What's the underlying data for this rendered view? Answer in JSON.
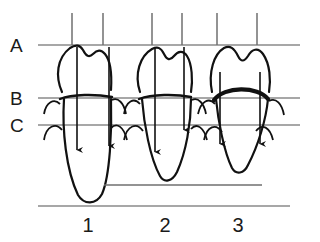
{
  "figure": {
    "background_color": "#ffffff",
    "ink_color": "#111111",
    "reference_line_color": "#8a8a8a"
  },
  "reference_lines": [
    {
      "label": "A",
      "y": 45,
      "x_start": 38,
      "x_end": 300,
      "description": "occlusal reference plane"
    },
    {
      "label": "B",
      "y": 98,
      "x_start": 38,
      "x_end": 300,
      "description": "cemento-enamel / gingival plane"
    },
    {
      "label": "C",
      "y": 125,
      "x_start": 38,
      "x_end": 300,
      "description": "alveolar bone crest plane"
    }
  ],
  "baselines": [
    {
      "name": "mid-baseline",
      "y": 185,
      "x_start": 104,
      "x_end": 262
    },
    {
      "name": "bottom-baseline",
      "y": 206,
      "x_start": 38,
      "x_end": 290
    }
  ],
  "tick_marks": [
    {
      "x": 72,
      "y_top": 13,
      "y_bottom": 45
    },
    {
      "x": 103,
      "y_top": 13,
      "y_bottom": 45
    },
    {
      "x": 152,
      "y_top": 13,
      "y_bottom": 45
    },
    {
      "x": 182,
      "y_top": 13,
      "y_bottom": 45
    },
    {
      "x": 217,
      "y_top": 13,
      "y_bottom": 45
    },
    {
      "x": 257,
      "y_top": 13,
      "y_bottom": 45
    }
  ],
  "teeth": [
    {
      "number": "1",
      "label_x": 88,
      "label_y": 232,
      "crown_tilt": "mesially inclined",
      "root_length": "long",
      "root_apex_y": 200,
      "arrows": [
        {
          "x": 77,
          "y_top": 47,
          "y_tip": 152,
          "length": "long"
        },
        {
          "x": 109,
          "y_top": 47,
          "y_tip": 148,
          "length": "long"
        }
      ]
    },
    {
      "number": "2",
      "label_x": 165,
      "label_y": 232,
      "crown_tilt": "upright",
      "root_length": "medium",
      "root_apex_y": 180,
      "arrows": [
        {
          "x": 155,
          "y_top": 47,
          "y_tip": 154,
          "length": "long"
        },
        {
          "x": 184,
          "y_top": 47,
          "y_tip": 132,
          "length": "short"
        }
      ]
    },
    {
      "number": "3",
      "label_x": 238,
      "label_y": 232,
      "crown_tilt": "upright",
      "root_length": "short",
      "root_apex_y": 175,
      "arrows": [
        {
          "x": 220,
          "y_top": 72,
          "y_tip": 146,
          "length": "short"
        },
        {
          "x": 260,
          "y_top": 72,
          "y_tip": 146,
          "length": "short"
        }
      ]
    }
  ]
}
